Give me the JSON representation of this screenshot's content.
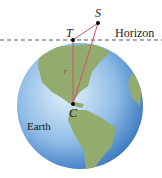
{
  "figure": {
    "labels": {
      "S": "S",
      "T": "T",
      "C": "C",
      "r": "r",
      "horizon": "Horizon",
      "earth": "Earth"
    },
    "colors": {
      "ocean_light": "#cfe3f5",
      "ocean_dark": "#3f7fc4",
      "land": "#8fa868",
      "sight_lines": "#d0506e",
      "horizon_line": "#555555"
    }
  }
}
